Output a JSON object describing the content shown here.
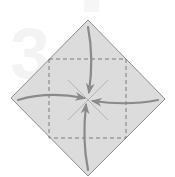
{
  "diagram": {
    "type": "origami-fold-step",
    "watermark": {
      "text": "3"
    },
    "colors": {
      "background": "#ffffff",
      "paper_fill": "#dcdcdc",
      "paper_edge": "#8c8c8c",
      "arrow": "#8a8a8a",
      "dashed_line": "#6f6f6f",
      "crease": "#b4b4b4",
      "watermark": "#f3f3f3"
    },
    "paper": {
      "shape": "diamond",
      "vertices": {
        "top": [
          88,
          20
        ],
        "right": [
          165,
          99
        ],
        "bottom": [
          88,
          176
        ],
        "left": [
          11,
          98
        ]
      }
    },
    "fold_lines": {
      "style": "dashed",
      "square": {
        "x": 49,
        "y": 59,
        "width": 77,
        "height": 79
      }
    },
    "creases": [
      {
        "from": [
          68,
          80
        ],
        "to": [
          108,
          120
        ]
      },
      {
        "from": [
          108,
          80
        ],
        "to": [
          68,
          120
        ]
      }
    ],
    "arrows": [
      {
        "name": "top-corner-arrow",
        "direction": "down"
      },
      {
        "name": "left-corner-arrow",
        "direction": "right"
      },
      {
        "name": "right-corner-arrow",
        "direction": "left"
      },
      {
        "name": "bottom-corner-arrow",
        "direction": "up"
      }
    ]
  }
}
